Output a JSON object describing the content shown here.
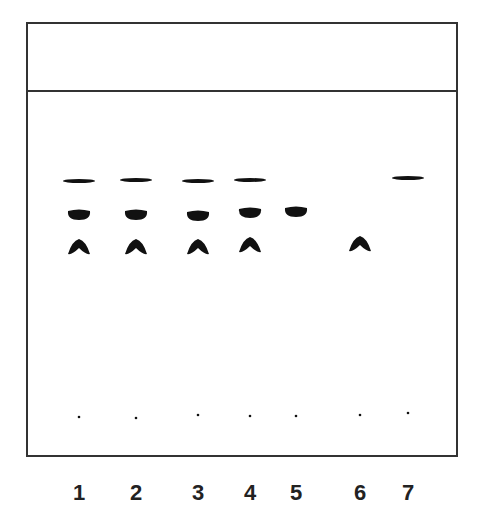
{
  "diagram": {
    "type": "TLC plate",
    "lanes": [
      {
        "label": "1",
        "x": 79,
        "spots": [
          "band",
          "oval",
          "chevron"
        ],
        "origin_y": 417
      },
      {
        "label": "2",
        "x": 136,
        "spots": [
          "band",
          "oval",
          "chevron"
        ],
        "origin_y": 418
      },
      {
        "label": "3",
        "x": 198,
        "spots": [
          "band",
          "oval",
          "chevron"
        ],
        "origin_y": 415
      },
      {
        "label": "4",
        "x": 250,
        "spots": [
          "band",
          "oval",
          "chevron"
        ],
        "origin_y": 416
      },
      {
        "label": "5",
        "x": 296,
        "spots": [
          "oval"
        ],
        "origin_y": 416
      },
      {
        "label": "6",
        "x": 360,
        "spots": [
          "chevron"
        ],
        "origin_y": 415
      },
      {
        "label": "7",
        "x": 408,
        "spots": [
          "band"
        ],
        "origin_y": 413
      }
    ],
    "spot_positions": {
      "band_y": [
        181,
        180,
        181,
        180,
        null,
        null,
        178
      ],
      "oval_y": [
        215,
        215,
        216,
        213,
        212,
        null,
        null
      ],
      "chevron_y": [
        247,
        247,
        247,
        245,
        null,
        244,
        null
      ]
    },
    "colors": {
      "ink": "#111111",
      "border": "#333333",
      "background": "#ffffff"
    }
  }
}
